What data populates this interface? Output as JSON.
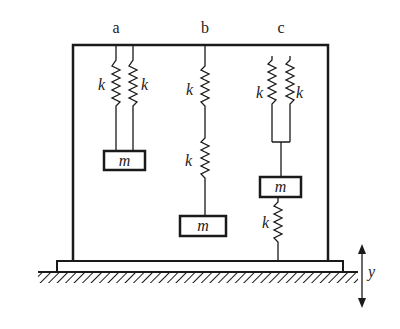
{
  "diagram": {
    "title_labels": {
      "a": "a",
      "b": "b",
      "c": "c"
    },
    "spring_label": "k",
    "mass_label": "m",
    "displacement_label": "y",
    "config_a": {
      "springs": [
        "k",
        "k"
      ],
      "arrangement": "parallel",
      "mass": "m"
    },
    "config_b": {
      "springs": [
        "k",
        "k"
      ],
      "arrangement": "series",
      "mass": "m"
    },
    "config_c": {
      "springs_top": [
        "k",
        "k"
      ],
      "arrangement_top": "parallel",
      "mass": "m",
      "spring_bottom": "k"
    },
    "colors": {
      "stroke": "#1a1a1a",
      "background": "#ffffff"
    }
  }
}
